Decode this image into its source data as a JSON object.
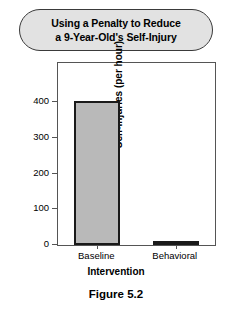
{
  "title_banner": {
    "line1": "Using a Penalty to Reduce",
    "line2": "a 9-Year-Old's Self-Injury",
    "fill_color": "#e2e2e2",
    "border_color": "#3a3a3a"
  },
  "caption": "Figure 5.2",
  "chart_data": {
    "type": "bar",
    "title": "Using a Penalty to Reduce a 9-Year-Old's Self-Injury",
    "categories": [
      "Baseline",
      "Behavioral"
    ],
    "values": [
      403,
      10
    ],
    "xlabel": "Intervention",
    "ylabel": "Self-Injuries (per hour)",
    "ylim": [
      0,
      510
    ],
    "yticks": [
      0,
      100,
      200,
      300,
      400
    ],
    "ytick_labels": [
      "0",
      "100",
      "200",
      "300",
      "400"
    ],
    "grid": false,
    "legend": false,
    "bar_fill_color": "#b9b9b9",
    "bar_border_color": "#1a1a1a",
    "axis_color": "#555555"
  }
}
